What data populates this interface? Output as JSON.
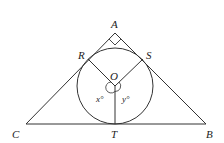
{
  "diagram": {
    "type": "geometry",
    "points": {
      "A": {
        "label": "A",
        "x": 115,
        "y": 33
      },
      "B": {
        "label": "B",
        "x": 206,
        "y": 124
      },
      "C": {
        "label": "C",
        "x": 26,
        "y": 124
      },
      "R": {
        "label": "R",
        "x": 88,
        "y": 59
      },
      "S": {
        "label": "S",
        "x": 143,
        "y": 59
      },
      "O": {
        "label": "O",
        "x": 115,
        "y": 86
      },
      "T": {
        "label": "T",
        "x": 115,
        "y": 124
      }
    },
    "circle": {
      "center": "O",
      "radius": 38
    },
    "angles": {
      "x": {
        "label": "x°"
      },
      "y": {
        "label": "y°"
      },
      "right_angle_at": "A"
    },
    "colors": {
      "stroke": "#333333",
      "background": "#ffffff"
    }
  }
}
